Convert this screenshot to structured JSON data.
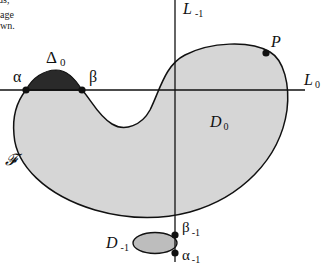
{
  "text_fragments": {
    "line1": "ds,",
    "line2": "age",
    "line3": "wn."
  },
  "labels": {
    "delta0": {
      "base": "Δ",
      "sub": "0"
    },
    "alpha": "α",
    "beta": "β",
    "L_minus1": {
      "base": "L",
      "sub": "-1"
    },
    "L0": {
      "base": "L",
      "sub": "0"
    },
    "P": "P",
    "D0": {
      "base": "D",
      "sub": "0"
    },
    "F": "𝓕",
    "D_minus1": {
      "base": "D",
      "sub": "-1"
    },
    "beta_minus1": {
      "base": "β",
      "sub": "-1"
    },
    "alpha_minus1": {
      "base": "α",
      "sub": "-1"
    }
  },
  "colors": {
    "region_fill": "#d6d6d6",
    "delta_fill": "#2a2a2a",
    "stroke": "#111111",
    "background": "#ffffff"
  }
}
